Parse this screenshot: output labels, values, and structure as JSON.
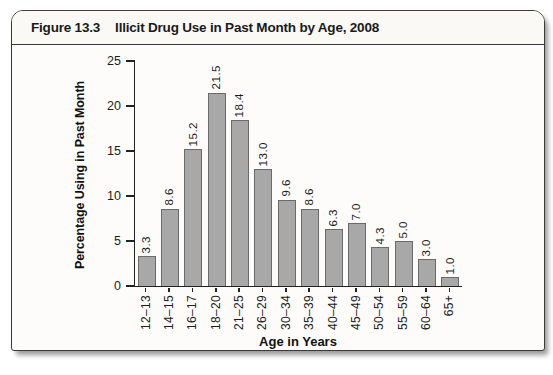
{
  "figure": {
    "label": "Figure 13.3",
    "title": "Illicit Drug Use in Past Month by Age, 2008"
  },
  "chart_data": {
    "type": "bar",
    "title": "Illicit Drug Use in Past Month by Age, 2008",
    "categories": [
      "12–13",
      "14–15",
      "16–17",
      "18–20",
      "21–25",
      "26–29",
      "30–34",
      "35–39",
      "40–44",
      "45–49",
      "50–54",
      "55–59",
      "60–64",
      "65+"
    ],
    "values": [
      3.3,
      8.6,
      15.2,
      21.5,
      18.4,
      13.0,
      9.6,
      8.6,
      6.3,
      7.0,
      4.3,
      5.0,
      3.0,
      1.0
    ],
    "value_labels": [
      "3.3",
      "8.6",
      "15.2",
      "21.5",
      "18.4",
      "13.0",
      "9.6",
      "8.6",
      "6.3",
      "7.0",
      "4.3",
      "5.0",
      "3.0",
      "1.0"
    ],
    "xlabel": "Age in Years",
    "ylabel": "Percentage Using in Past Month",
    "ylim": [
      0,
      25
    ],
    "yticks": [
      0,
      5,
      10,
      15,
      20,
      25
    ],
    "grid": false,
    "legend_position": "none",
    "bar_color": "#a8a8a8",
    "bar_border_color": "#6a6a6a",
    "axis_color": "#222222"
  }
}
